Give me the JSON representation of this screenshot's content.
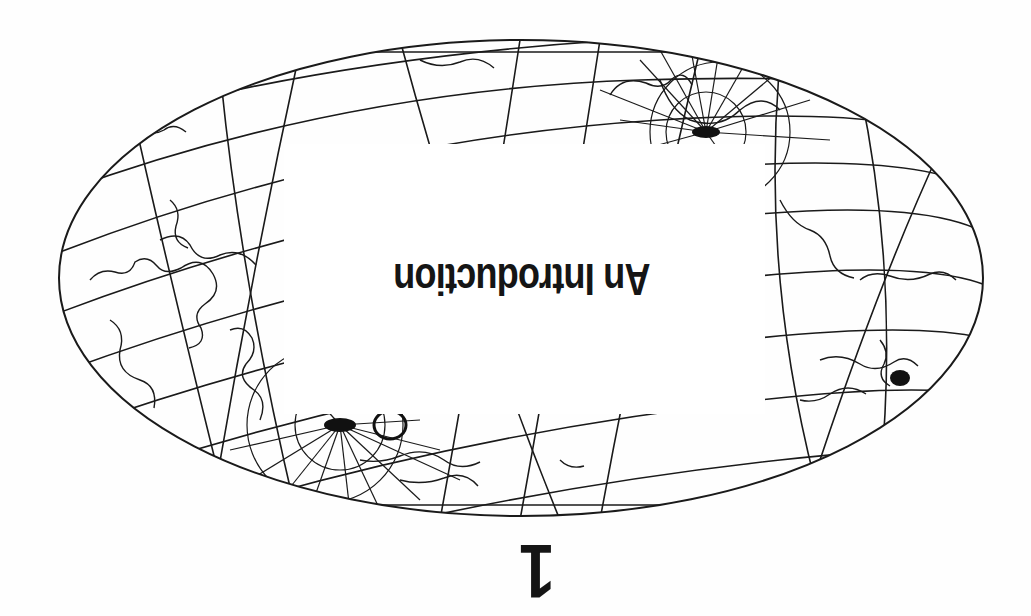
{
  "page": {
    "orientation": "rotated-180",
    "background": "#fefefe",
    "ink_color": "#151515"
  },
  "illustration": {
    "type": "world-map-oblique-projection",
    "description": "Oblique elliptical world map projection with graticule and coastlines, two pole convergence points",
    "ellipse": {
      "cx": 521,
      "cy": 278,
      "rx": 462,
      "ry": 238
    }
  },
  "chapter": {
    "title": "An Introduction",
    "number": "1"
  }
}
